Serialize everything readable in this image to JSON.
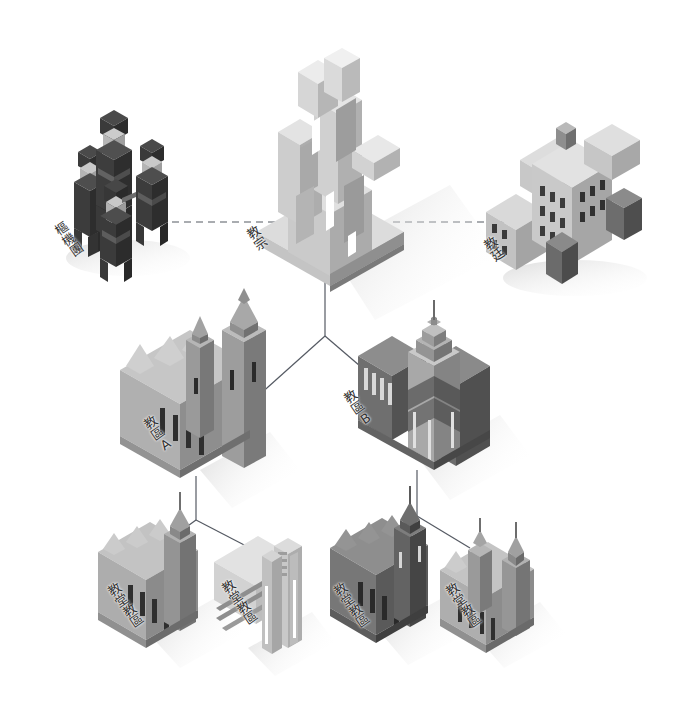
{
  "diagram": {
    "type": "hierarchy-isometric",
    "background_color": "#ffffff",
    "line_color": "#555a63",
    "label_color": "#333333",
    "palette": {
      "light": "#d8d8d8",
      "light2": "#c6c6c6",
      "mid": "#a8a8a8",
      "mid2": "#909090",
      "dark": "#6e6e6e",
      "dark2": "#585858",
      "darkest": "#3a3a3a",
      "shadow": "#e9e9e9"
    },
    "nodes": [
      {
        "id": "cardinals",
        "label": "樞機團",
        "level": 0,
        "icon": "people-group-icon",
        "x": 118,
        "y": 190,
        "label_x": 52,
        "label_y": 228,
        "tone": "darkest"
      },
      {
        "id": "pope",
        "label": "教宗",
        "level": 0,
        "icon": "cathedral-tower-icon",
        "x": 330,
        "y": 165,
        "label_x": 243,
        "label_y": 232,
        "tone": "light"
      },
      {
        "id": "holy-see",
        "label": "教廷",
        "level": 0,
        "icon": "curia-building-icon",
        "x": 560,
        "y": 190,
        "label_x": 480,
        "label_y": 243,
        "tone": "light2"
      },
      {
        "id": "diocese-a",
        "label": "教區A",
        "level": 1,
        "icon": "cathedral-icon",
        "x": 205,
        "y": 400,
        "label_x": 140,
        "label_y": 422,
        "tone": "mid"
      },
      {
        "id": "diocese-b",
        "label": "教區B",
        "level": 1,
        "icon": "basilica-icon",
        "x": 420,
        "y": 400,
        "label_x": 340,
        "label_y": 395,
        "tone": "dark"
      },
      {
        "id": "parish-1",
        "label": "教堂教區",
        "level": 2,
        "icon": "church-icon",
        "x": 155,
        "y": 575,
        "label_x": 104,
        "label_y": 588,
        "tone": "mid"
      },
      {
        "id": "parish-2",
        "label": "教堂教區",
        "level": 2,
        "icon": "church-icon",
        "x": 268,
        "y": 580,
        "label_x": 218,
        "label_y": 585,
        "tone": "light"
      },
      {
        "id": "parish-3",
        "label": "教堂教區",
        "level": 2,
        "icon": "church-icon",
        "x": 385,
        "y": 575,
        "label_x": 330,
        "label_y": 588,
        "tone": "dark"
      },
      {
        "id": "parish-4",
        "label": "教堂教區",
        "level": 2,
        "icon": "church-icon",
        "x": 490,
        "y": 580,
        "label_x": 442,
        "label_y": 588,
        "tone": "mid"
      }
    ],
    "connections": [
      {
        "from": "cardinals",
        "to": "pope",
        "style": "dashed",
        "orientation": "horizontal"
      },
      {
        "from": "pope",
        "to": "holy-see",
        "style": "dashed",
        "orientation": "horizontal"
      },
      {
        "from": "pope",
        "to": "diocese-a",
        "style": "solid",
        "orientation": "tree"
      },
      {
        "from": "pope",
        "to": "diocese-b",
        "style": "solid",
        "orientation": "tree"
      },
      {
        "from": "diocese-a",
        "to": "parish-1",
        "style": "solid",
        "orientation": "tree"
      },
      {
        "from": "diocese-a",
        "to": "parish-2",
        "style": "solid",
        "orientation": "tree"
      },
      {
        "from": "diocese-b",
        "to": "parish-3",
        "style": "solid",
        "orientation": "tree"
      },
      {
        "from": "diocese-b",
        "to": "parish-4",
        "style": "solid",
        "orientation": "tree"
      }
    ]
  }
}
